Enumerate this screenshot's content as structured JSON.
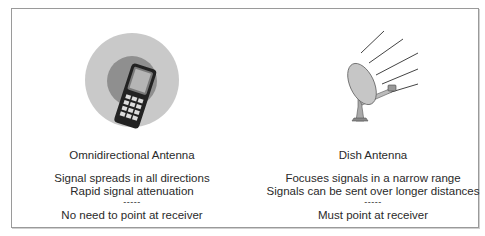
{
  "diagram": {
    "panels": [
      {
        "id": "omnidirectional",
        "illustration": "mobile-phone-with-radiation-circles",
        "title": "Omnidirectional Antenna",
        "lines": [
          "Signal spreads in all directions",
          "Rapid signal attenuation"
        ],
        "separator": "-----",
        "footer": "No need to point at receiver"
      },
      {
        "id": "dish",
        "illustration": "satellite-dish-with-signal-rays",
        "title": "Dish Antenna",
        "lines": [
          "Focuses signals in a narrow range",
          "Signals can be sent over longer distances"
        ],
        "separator": "-----",
        "footer": "Must point at receiver"
      }
    ],
    "colors": {
      "outer_circle": "#c8c8c8",
      "inner_circle": "#8e8e8e",
      "phone_body": "#2b2b2b",
      "dish": "#bdbdbd",
      "border": "#9a9a9a",
      "text": "#2a2a2a"
    }
  }
}
